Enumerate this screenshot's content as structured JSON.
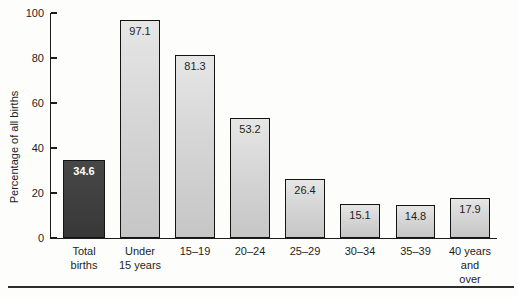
{
  "figure": {
    "background_color": "#fdfdfc",
    "axis_color": "#1c1c1c",
    "bottom_rule_color": "#2d2d2d"
  },
  "chart_data": {
    "type": "bar",
    "title": "",
    "xlabel": "",
    "ylabel": "Percentage of all births",
    "ylim": [
      0,
      100
    ],
    "yticks": [
      0,
      20,
      40,
      60,
      80,
      100
    ],
    "grid": false,
    "legend": null,
    "categories": [
      "Total births",
      "Under 15 years",
      "15–19",
      "20–24",
      "25–29",
      "30–34",
      "35–39",
      "40 years and over"
    ],
    "category_label_lines": [
      [
        "Total",
        "births"
      ],
      [
        "Under",
        "15 years"
      ],
      [
        "15–19"
      ],
      [
        "20–24"
      ],
      [
        "25–29"
      ],
      [
        "30–34"
      ],
      [
        "35–39"
      ],
      [
        "40 years",
        "and",
        "over"
      ]
    ],
    "values": [
      34.6,
      97.1,
      81.3,
      53.2,
      26.4,
      15.1,
      14.8,
      17.9
    ],
    "value_labels": [
      "34.6",
      "97.1",
      "81.3",
      "53.2",
      "26.4",
      "15.1",
      "14.8",
      "17.9"
    ],
    "highlight_index": 0,
    "colors": {
      "bar_fill_light": "#d6d6d6",
      "bar_fill_dark": "#3e3e3e",
      "bar_border": "#141414",
      "value_text_light_bars": "#1e1e1e",
      "value_text_dark_bar": "#ffffff"
    }
  }
}
